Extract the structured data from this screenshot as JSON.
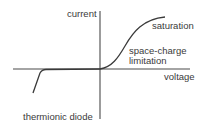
{
  "diagram": {
    "title": "thermionic diode",
    "axes": {
      "x_label": "voltage",
      "y_label": "current"
    },
    "annotations": {
      "saturation": "saturation",
      "space_charge_line1": "space-charge",
      "space_charge_line2": "limitation"
    },
    "colors": {
      "line": "#3a3a3a",
      "axis": "#4a4a4a",
      "background": "#ffffff"
    }
  }
}
